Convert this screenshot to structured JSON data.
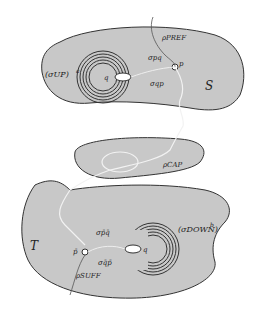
{
  "figure": {
    "regions": [
      {
        "id": "S",
        "label": "S"
      },
      {
        "id": "CAP",
        "label": "ρCAP"
      },
      {
        "id": "T",
        "label": "T"
      }
    ],
    "top": {
      "winding_label": "(σUP)",
      "winding_exp": "a",
      "q_label": "q",
      "p_label": "p",
      "sigma_pq": "σpq",
      "sigma_qp": "σqp",
      "prefix_label": "ρPREF"
    },
    "middle": {
      "cap_label": "ρCAP"
    },
    "bottom": {
      "winding_label": "(σDOWN)",
      "winding_exp": "b",
      "q_label": "q",
      "p_label": "p̄",
      "sigma_pq": "σp̄q̄",
      "sigma_qp": "σq̄p̄",
      "suffix_label": "ρSUFF",
      "region_label": "T"
    },
    "colors": {
      "region_fill": "#c8c8c8",
      "outline": "#333333",
      "path": "#f2f2f2",
      "ring": "#333333"
    }
  }
}
